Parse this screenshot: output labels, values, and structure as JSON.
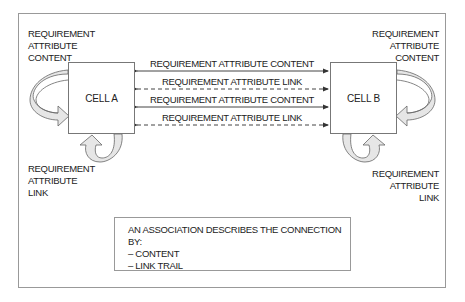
{
  "diagram": {
    "cell_a": {
      "label": "CELL A"
    },
    "cell_b": {
      "label": "CELL B"
    },
    "self_labels": {
      "a_content": [
        "REQUIREMENT",
        "ATTRIBUTE",
        "CONTENT"
      ],
      "a_link": [
        "REQUIREMENT",
        "ATTRIBUTE",
        "LINK"
      ],
      "b_content": [
        "REQUIREMENT",
        "ATTRIBUTE",
        "CONTENT"
      ],
      "b_link": [
        "REQUIREMENT",
        "ATTRIBUTE",
        "LINK"
      ]
    },
    "connections": [
      {
        "label": "REQUIREMENT ATTRIBUTE CONTENT",
        "style": "solid",
        "direction": "bidirectional"
      },
      {
        "label": "REQUIREMENT ATTRIBUTE LINK",
        "style": "dashed",
        "direction": "bidirectional"
      },
      {
        "label": "REQUIREMENT ATTRIBUTE CONTENT",
        "style": "solid",
        "direction": "bidirectional"
      },
      {
        "label": "REQUIREMENT ATTRIBUTE LINK",
        "style": "dashed",
        "direction": "bidirectional"
      }
    ],
    "association_box": {
      "title": "AN ASSOCIATION DESCRIBES THE CONNECTION BY:",
      "items": [
        "– CONTENT",
        "– LINK TRAIL"
      ]
    },
    "colors": {
      "line": "#444444",
      "curved_arrow_fill": "#e6e6e6",
      "border": "#999999"
    }
  }
}
